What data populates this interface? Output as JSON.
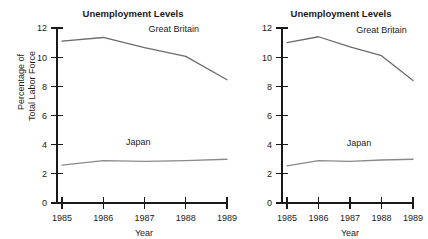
{
  "chart_data": [
    {
      "type": "line",
      "panel": "left",
      "title": "Unemployment Levels",
      "xlabel": "Year",
      "ylabel": "Percentage of\nTotal Labor Force",
      "ylabel_line1": "Percentage of",
      "ylabel_line2": "Total Labor Force",
      "categories": [
        "1985",
        "1986",
        "1987",
        "1988",
        "1989"
      ],
      "x": [
        1985,
        1986,
        1987,
        1988,
        1989
      ],
      "xlim": [
        1985,
        1989
      ],
      "ylim": [
        0,
        12
      ],
      "yticks": [
        "0",
        "2",
        "4",
        "6",
        "8",
        "10",
        "12"
      ],
      "ytick_values": [
        0,
        2,
        4,
        6,
        8,
        10,
        12
      ],
      "grid": false,
      "legend_position": "inline-annotation",
      "series": [
        {
          "name": "Great Britain",
          "values": [
            11.1,
            11.35,
            10.65,
            10.05,
            8.45
          ],
          "color": "#6b6b6b",
          "label_x": 1987.1,
          "label_y": 11.7
        },
        {
          "name": "Japan",
          "values": [
            2.6,
            2.9,
            2.85,
            2.9,
            3.0
          ],
          "color": "#8a8a8a",
          "label_x": 1986.55,
          "label_y": 3.95
        }
      ]
    },
    {
      "type": "line",
      "panel": "right",
      "title": "Unemployment Levels",
      "xlabel": "Year",
      "ylabel": "",
      "categories": [
        "1985",
        "1986",
        "1987",
        "1988",
        "1989"
      ],
      "x": [
        1985,
        1986,
        1987,
        1988,
        1989
      ],
      "xlim": [
        1985,
        1989
      ],
      "ylim": [
        0,
        12
      ],
      "yticks": [
        "0",
        "2",
        "4",
        "6",
        "8",
        "10",
        "12"
      ],
      "ytick_values": [
        0,
        2,
        4,
        6,
        8,
        10,
        12
      ],
      "grid": false,
      "legend_position": "inline-annotation",
      "series": [
        {
          "name": "Great Britain",
          "values": [
            11.0,
            11.4,
            10.7,
            10.1,
            8.4
          ],
          "color": "#6b6b6b",
          "label_x": 1987.2,
          "label_y": 11.65
        },
        {
          "name": "Japan",
          "values": [
            2.55,
            2.9,
            2.85,
            2.95,
            3.0
          ],
          "color": "#8a8a8a",
          "label_x": 1986.9,
          "label_y": 3.9
        }
      ]
    }
  ],
  "colors": {
    "background": "#ffffff",
    "axis": "#1a1a1a",
    "text": "#1a1a1a",
    "great_britain_line": "#6b6b6b",
    "japan_line": "#8a8a8a"
  }
}
